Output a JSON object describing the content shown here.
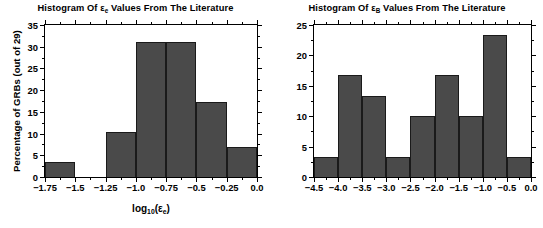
{
  "figure": {
    "background": "#ffffff",
    "bar_fill": "#4a4a4a",
    "bar_edge": "#1a1a1a",
    "axis_color": "#000000"
  },
  "panels": [
    {
      "id": "left",
      "title_parts": {
        "pre": "Histogram Of ",
        "sym": "ε",
        "sub": "e",
        "post": " Values From The Literature"
      },
      "ylabel_parts": {
        "pre": "Percentage of GRBs (out of ",
        "n": "29",
        "post": ")"
      },
      "xlabel_parts": {
        "pre": "log",
        "base": "10",
        "open": "(",
        "sym": "ε",
        "sub": "e",
        "close": ")"
      }
    },
    {
      "id": "right",
      "title_parts": {
        "pre": "Histogram Of ",
        "sym": "ε",
        "sub": "B",
        "post": " Values From The Literature"
      },
      "ylabel_parts": {
        "pre": "Percentage of GRBs (out of ",
        "n": "30",
        "post": ")"
      },
      "xlabel_parts": {
        "pre": "log",
        "base": "10",
        "open": "(",
        "sym": "ε",
        "sub": "B",
        "close": ")"
      }
    }
  ],
  "chart_data": [
    {
      "type": "bar",
      "id": "histogram-epsilon-e",
      "title": "Histogram Of ε_e Values From The Literature",
      "xlabel": "log10(ε_e)",
      "ylabel": "Percentage of GRBs (out of 29)",
      "sample_size": 29,
      "xlim": [
        -1.75,
        0.0
      ],
      "ylim": [
        0,
        35
      ],
      "bin_width": 0.25,
      "grid": false,
      "legend": null,
      "xticks": [
        -1.75,
        -1.5,
        -1.25,
        -1.0,
        -0.75,
        -0.5,
        -0.25,
        0.0
      ],
      "xticklabels": [
        "-1.75",
        "-1.5",
        "-1.25",
        "-1.0",
        "-0.75",
        "-0.5",
        "-0.25",
        "0.0"
      ],
      "yticks": [
        0,
        5,
        10,
        15,
        20,
        25,
        30,
        35
      ],
      "yticklabels": [
        "0",
        "5",
        "10",
        "15",
        "20",
        "25",
        "30",
        "35"
      ],
      "bins": [
        {
          "x0": -1.75,
          "x1": -1.5,
          "value": 3.4
        },
        {
          "x0": -1.5,
          "x1": -1.25,
          "value": 0.0
        },
        {
          "x0": -1.25,
          "x1": -1.0,
          "value": 10.3
        },
        {
          "x0": -1.0,
          "x1": -0.75,
          "value": 31.0
        },
        {
          "x0": -0.75,
          "x1": -0.5,
          "value": 31.0
        },
        {
          "x0": -0.5,
          "x1": -0.25,
          "value": 17.2
        },
        {
          "x0": -0.25,
          "x1": 0.0,
          "value": 6.9
        }
      ],
      "categories": [
        "-1.75..-1.5",
        "-1.5..-1.25",
        "-1.25..-1.0",
        "-1.0..-0.75",
        "-0.75..-0.5",
        "-0.5..-0.25",
        "-0.25..0.0"
      ],
      "values": [
        3.4,
        0.0,
        10.3,
        31.0,
        31.0,
        17.2,
        6.9
      ]
    },
    {
      "type": "bar",
      "id": "histogram-epsilon-B",
      "title": "Histogram Of ε_B Values From The Literature",
      "xlabel": "log10(ε_B)",
      "ylabel": "Percentage of GRBs (out of 30)",
      "sample_size": 30,
      "xlim": [
        -4.5,
        0.0
      ],
      "ylim": [
        0,
        25
      ],
      "bin_width": 0.5,
      "grid": false,
      "legend": null,
      "xticks": [
        -4.5,
        -4.0,
        -3.5,
        -3.0,
        -2.5,
        -2.0,
        -1.5,
        -1.0,
        -0.5,
        0.0
      ],
      "xticklabels": [
        "-4.5",
        "-4.0",
        "-3.5",
        "-3.0",
        "-2.5",
        "-2.0",
        "-1.5",
        "-1.0",
        "-0.5",
        "0.0"
      ],
      "yticks": [
        0,
        5,
        10,
        15,
        20,
        25
      ],
      "yticklabels": [
        "0",
        "5",
        "10",
        "15",
        "20",
        "25"
      ],
      "bins": [
        {
          "x0": -4.5,
          "x1": -4.0,
          "value": 3.3
        },
        {
          "x0": -4.0,
          "x1": -3.5,
          "value": 16.7
        },
        {
          "x0": -3.5,
          "x1": -3.0,
          "value": 13.3
        },
        {
          "x0": -3.0,
          "x1": -2.5,
          "value": 3.3
        },
        {
          "x0": -2.5,
          "x1": -2.0,
          "value": 10.0
        },
        {
          "x0": -2.0,
          "x1": -1.5,
          "value": 16.7
        },
        {
          "x0": -1.5,
          "x1": -1.0,
          "value": 10.0
        },
        {
          "x0": -1.0,
          "x1": -0.5,
          "value": 23.3
        },
        {
          "x0": -0.5,
          "x1": 0.0,
          "value": 3.3
        }
      ],
      "categories": [
        "-4.5..-4.0",
        "-4.0..-3.5",
        "-3.5..-3.0",
        "-3.0..-2.5",
        "-2.5..-2.0",
        "-2.0..-1.5",
        "-1.5..-1.0",
        "-1.0..-0.5",
        "-0.5..0.0"
      ],
      "values": [
        3.3,
        16.7,
        13.3,
        3.3,
        10.0,
        16.7,
        10.0,
        23.3,
        3.3
      ]
    }
  ]
}
